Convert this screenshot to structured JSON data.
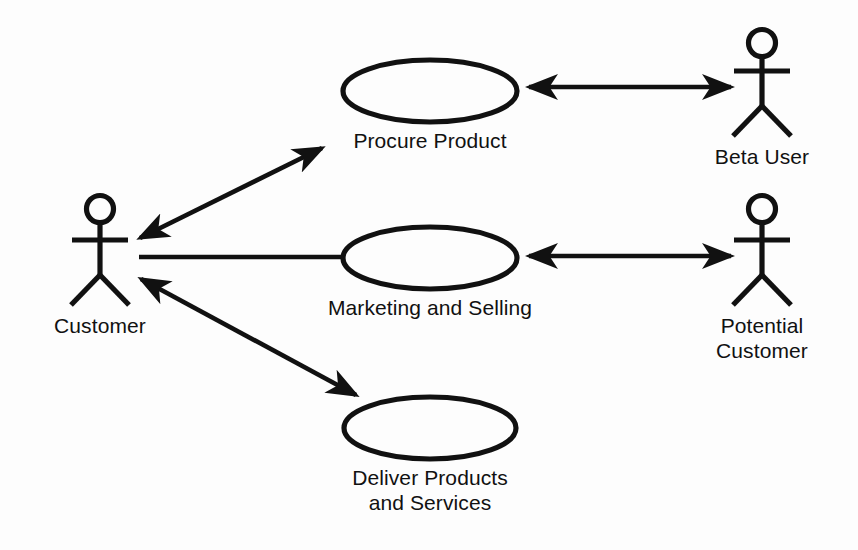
{
  "diagram": {
    "type": "uml-use-case-diagram",
    "title": "",
    "background_color": "#fdfdfd",
    "stroke_color": "#111111",
    "text_color": "#111111",
    "actors": [
      {
        "id": "customer",
        "label": "Customer",
        "icon": "stick-figure-actor-icon",
        "position": {
          "x": 100,
          "y": 250
        },
        "label_position": {
          "x": 100,
          "y": 325
        }
      },
      {
        "id": "beta-user",
        "label": "Beta User",
        "icon": "stick-figure-actor-icon",
        "position": {
          "x": 762,
          "y": 82
        },
        "label_position": {
          "x": 762,
          "y": 158
        }
      },
      {
        "id": "potential-customer",
        "label": "Potential\nCustomer",
        "label_line_1": "Potential",
        "label_line_2": "Customer",
        "icon": "stick-figure-actor-icon",
        "position": {
          "x": 762,
          "y": 250
        },
        "label_position": {
          "x": 762,
          "y": 325
        }
      }
    ],
    "use_cases": [
      {
        "id": "procure-product",
        "label": "Procure Product",
        "shape": "ellipse",
        "center": {
          "x": 430,
          "y": 91
        },
        "radius": {
          "rx": 87,
          "ry": 31
        },
        "label_position": {
          "x": 430,
          "y": 132
        }
      },
      {
        "id": "marketing-and-selling",
        "label": "Marketing and Selling",
        "shape": "ellipse",
        "center": {
          "x": 430,
          "y": 258
        },
        "radius": {
          "rx": 87,
          "ry": 31
        },
        "label_position": {
          "x": 430,
          "y": 299
        }
      },
      {
        "id": "deliver-products-and-services",
        "label": "Deliver Products\nand Services",
        "label_line_1": "Deliver Products",
        "label_line_2": "and Services",
        "shape": "ellipse",
        "center": {
          "x": 430,
          "y": 428
        },
        "radius": {
          "rx": 86,
          "ry": 31
        },
        "label_position": {
          "x": 430,
          "y": 469
        }
      }
    ],
    "connections": [
      {
        "id": "customer-procure-product",
        "from": "customer",
        "to": "procure-product",
        "arrow_style": "double-headed",
        "x1": 140,
        "y1": 238,
        "x2": 322,
        "y2": 148
      },
      {
        "id": "customer-marketing-and-selling",
        "from": "customer",
        "to": "marketing-and-selling",
        "arrow_style": "plain-line",
        "x1": 139,
        "y1": 257,
        "x2": 344,
        "y2": 257
      },
      {
        "id": "customer-deliver-products",
        "from": "customer",
        "to": "deliver-products-and-services",
        "arrow_style": "double-headed",
        "x1": 141,
        "y1": 279,
        "x2": 356,
        "y2": 395
      },
      {
        "id": "procure-product-beta-user",
        "from": "procure-product",
        "to": "beta-user",
        "arrow_style": "double-headed",
        "x1": 529,
        "y1": 87,
        "x2": 731,
        "y2": 87
      },
      {
        "id": "marketing-and-selling-potential-customer",
        "from": "marketing-and-selling",
        "to": "potential-customer",
        "arrow_style": "double-headed",
        "x1": 529,
        "y1": 256,
        "x2": 731,
        "y2": 256
      }
    ]
  }
}
